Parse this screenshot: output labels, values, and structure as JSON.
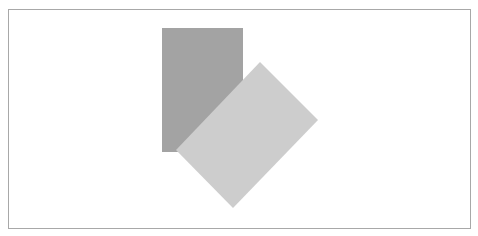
{
  "diagram": {
    "frame": {
      "x": 8,
      "y": 9,
      "width": 463,
      "height": 220,
      "border_color": "#a8a8a8"
    },
    "shapes": [
      {
        "name": "dark-rectangle",
        "type": "rect",
        "x": 162,
        "y": 28,
        "width": 81,
        "height": 124,
        "fill": "#a3a3a3"
      },
      {
        "name": "light-rotated-rectangle",
        "type": "polygon",
        "points": "260,62 318,120 233,208 176,150",
        "fill": "#cdcdcd"
      }
    ]
  }
}
